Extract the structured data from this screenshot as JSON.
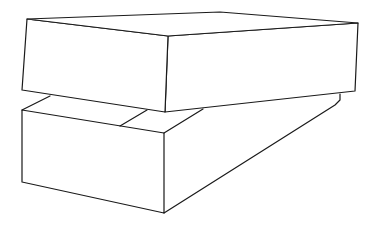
{
  "figure": {
    "stroke_color": "#1a1a1a",
    "background": "#ffffff",
    "top_box": {
      "top_face": [
        [
          27,
          19
        ],
        [
          220,
          12
        ],
        [
          358,
          23
        ],
        [
          168,
          36
        ]
      ],
      "front_face": [
        [
          27,
          19
        ],
        [
          168,
          36
        ],
        [
          165,
          112
        ],
        [
          22,
          90
        ]
      ],
      "right_face": [
        [
          168,
          36
        ],
        [
          358,
          23
        ],
        [
          355,
          91
        ],
        [
          165,
          112
        ]
      ]
    },
    "bottom_box": {
      "front_face": [
        [
          22,
          110
        ],
        [
          164,
          133
        ],
        [
          164,
          213
        ],
        [
          22,
          182
        ]
      ],
      "top_left_edge": [
        [
          22,
          110
        ],
        [
          50,
          96
        ]
      ],
      "top_right_edge": [
        [
          164,
          133
        ],
        [
          203,
          109
        ]
      ],
      "divider": [
        [
          120,
          126
        ],
        [
          147,
          110
        ]
      ],
      "right_back_edge": [
        [
          340,
          94
        ],
        [
          340,
          100
        ],
        [
          335,
          105
        ],
        [
          164,
          213
        ]
      ]
    }
  }
}
